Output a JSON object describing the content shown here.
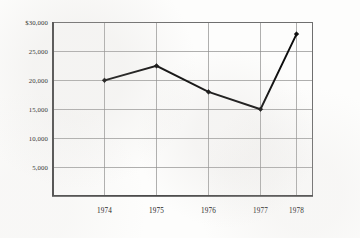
{
  "chart_data": {
    "type": "line",
    "title": "",
    "subtitle": "",
    "xlabel": "",
    "ylabel": "",
    "categories": [
      "1974",
      "1975",
      "1976",
      "1977",
      "1978"
    ],
    "x": [
      1974,
      1975,
      1976,
      1977,
      1978
    ],
    "values": [
      20000,
      22500,
      18000,
      15000,
      28000
    ],
    "series": [
      {
        "name": "",
        "values": [
          20000,
          22500,
          18000,
          15000,
          28000
        ]
      }
    ],
    "ylim": [
      0,
      30000
    ],
    "xlim": [
      1973.5,
      1978.5
    ],
    "ytick_labels": [
      "$30,000",
      "25,000",
      "20,000",
      "15,000",
      "10,000",
      "5,000"
    ],
    "ytick_values": [
      30000,
      25000,
      20000,
      15000,
      10000,
      5000
    ],
    "xtick_labels": [
      "1974",
      "1975",
      "1976",
      "1977",
      "1978"
    ],
    "grid": true,
    "grid_axis": "both",
    "legend": false,
    "legend_position": "none",
    "annotations": [],
    "marker": "diamond",
    "line_color": "#0d0d0d",
    "grid_color": "#8d8d8d",
    "background_color": "#fdfdfc"
  },
  "axes": {
    "y": {
      "ticks": [
        {
          "label": "$30,000",
          "value": 30000
        },
        {
          "label": "25,000",
          "value": 25000
        },
        {
          "label": "20,000",
          "value": 20000
        },
        {
          "label": "15,000",
          "value": 15000
        },
        {
          "label": "10,000",
          "value": 10000
        },
        {
          "label": "5,000",
          "value": 5000
        }
      ]
    },
    "x": {
      "ticks": [
        {
          "label": "1974",
          "value": 1974
        },
        {
          "label": "1975",
          "value": 1975
        },
        {
          "label": "1976",
          "value": 1976
        },
        {
          "label": "1977",
          "value": 1977
        },
        {
          "label": "1978",
          "value": 1978
        }
      ]
    }
  },
  "points": [
    {
      "x_label": "1974",
      "value": 20000
    },
    {
      "x_label": "1975",
      "value": 22500
    },
    {
      "x_label": "1976",
      "value": 18000
    },
    {
      "x_label": "1977",
      "value": 15000
    },
    {
      "x_label": "1978",
      "value": 28000
    }
  ]
}
